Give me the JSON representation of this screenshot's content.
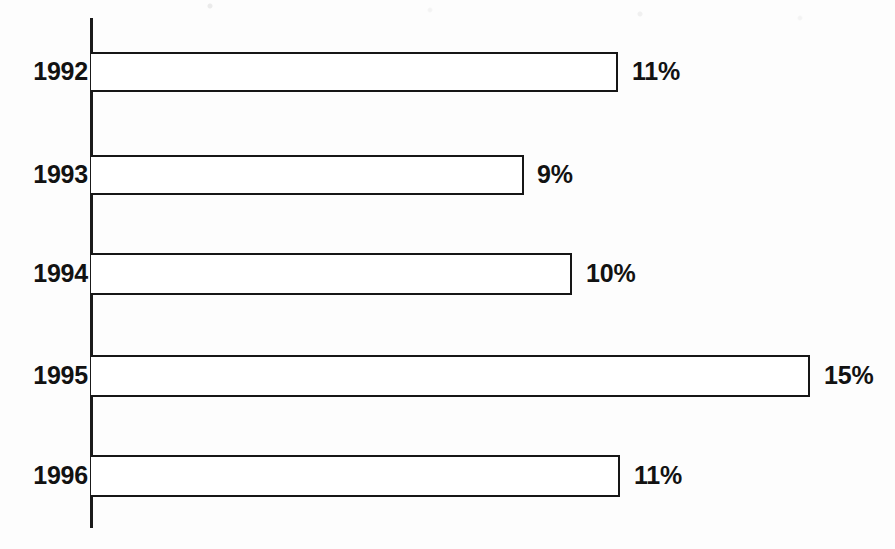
{
  "chart_data": {
    "type": "bar",
    "orientation": "horizontal",
    "title": "",
    "subtitle": "",
    "xlabel": "",
    "ylabel": "",
    "categories": [
      "1992",
      "1993",
      "1994",
      "1995",
      "1996"
    ],
    "values": [
      11,
      9,
      10,
      15,
      11
    ],
    "value_labels": [
      "11%",
      "9%",
      "10%",
      "15%",
      "11%"
    ],
    "unit": "%",
    "xlim": [
      0,
      15
    ],
    "grid": false,
    "legend": null,
    "axis_visible": {
      "category_axis": true,
      "value_axis": false
    },
    "bar_style": {
      "fill": "#ffffff",
      "outline": "#161616",
      "outline_width_px": 2.5
    },
    "colors": {
      "background": "#fdfdfd",
      "ink": "#121212",
      "axis": "#1a1a1a"
    },
    "geometry": {
      "axis_x_px": 91,
      "px_per_unit": 47.9,
      "bar_height_px": 41,
      "label_gap_px": 14
    },
    "bars": [
      {
        "category": "1992",
        "value": 11,
        "label": "11%",
        "top_px": 52,
        "height_px": 40,
        "end_x_px": 618,
        "label_x_px": 632
      },
      {
        "category": "1993",
        "value": 9,
        "label": "9%",
        "top_px": 155,
        "height_px": 40,
        "end_x_px": 524,
        "label_x_px": 537
      },
      {
        "category": "1994",
        "value": 10,
        "label": "10%",
        "top_px": 253,
        "height_px": 42,
        "end_x_px": 572,
        "label_x_px": 586
      },
      {
        "category": "1995",
        "value": 15,
        "label": "15%",
        "top_px": 355,
        "height_px": 42,
        "end_x_px": 810,
        "label_x_px": 824
      },
      {
        "category": "1996",
        "value": 11,
        "label": "11%",
        "top_px": 455,
        "height_px": 42,
        "end_x_px": 620,
        "label_x_px": 634
      }
    ]
  }
}
